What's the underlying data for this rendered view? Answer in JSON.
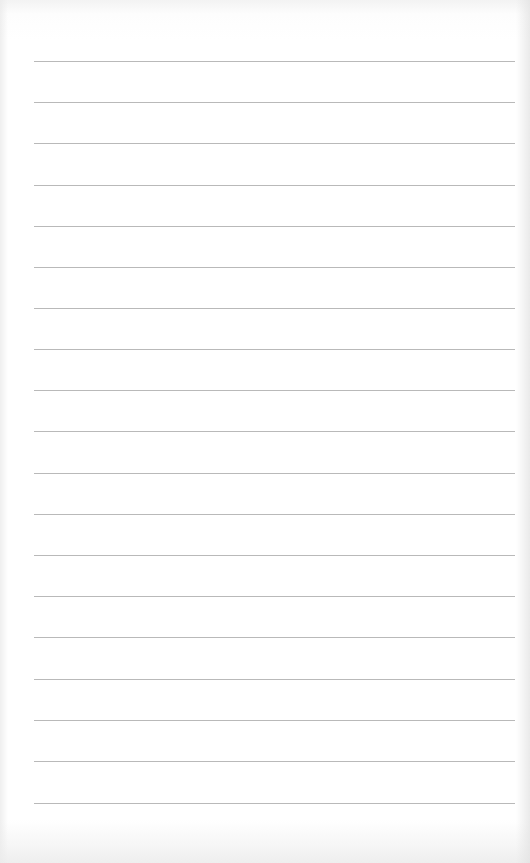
{
  "page": {
    "type": "lined-paper",
    "background_color": "#ffffff",
    "rule_color": "#b9b9b9",
    "rule_count": 19,
    "rules_y": [
      61,
      102,
      143,
      185,
      226,
      267,
      308,
      349,
      390,
      431,
      473,
      514,
      555,
      596,
      637,
      679,
      720,
      761,
      803
    ]
  }
}
